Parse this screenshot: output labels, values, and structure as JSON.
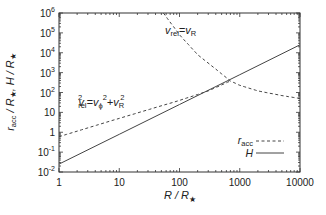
{
  "chart_data": {
    "type": "line",
    "title": "",
    "xlabel": "R / R★",
    "ylabel": "r_acc / R★, H / R★",
    "xscale": "log",
    "yscale": "log",
    "xlim": [
      1,
      10000
    ],
    "ylim": [
      0.01,
      1000000
    ],
    "grid": false,
    "legend_position": "lower right inside",
    "x_ticks": [
      "1",
      "10",
      "100",
      "1000",
      "10000"
    ],
    "y_ticks": [
      "10^-2",
      "10^-1",
      "1",
      "10",
      "10^2",
      "10^3",
      "10^4",
      "10^5",
      "10^6"
    ],
    "series": [
      {
        "name": "r_acc",
        "style": "dashed",
        "segments": [
          {
            "label": "v_rel^2 = v_phi^2 + v_R^2",
            "x": [
              1,
              10,
              100,
              300,
              700
            ],
            "y": [
              0.6,
              5,
              40,
              120,
              380
            ]
          },
          {
            "label": "v_rel = v_R",
            "x": [
              54,
              100,
              200,
              400,
              700,
              1000,
              2000,
              5000,
              10000
            ],
            "y": [
              1000000,
              80000,
              8000,
              1500,
              380,
              230,
              120,
              70,
              50
            ]
          }
        ]
      },
      {
        "name": "H",
        "style": "solid",
        "x": [
          1,
          10,
          100,
          1000,
          10000
        ],
        "y": [
          0.025,
          0.79,
          25,
          790,
          25000
        ]
      }
    ],
    "annotations": [
      {
        "text": "v_rel = v_R",
        "x": 150,
        "y": 200000
      },
      {
        "text": "v_rel^2 = v_phi^2 + v_R^2",
        "x": 3,
        "y": 30
      }
    ]
  },
  "labels": {
    "x_ticks": [
      "1",
      "10",
      "100",
      "1000",
      "10000"
    ],
    "y_ticks": [
      {
        "base": "10",
        "exp": "-2"
      },
      {
        "base": "10",
        "exp": "-1"
      },
      {
        "base": "1",
        "exp": ""
      },
      {
        "base": "10",
        "exp": ""
      },
      {
        "base": "10",
        "exp": "2"
      },
      {
        "base": "10",
        "exp": "3"
      },
      {
        "base": "10",
        "exp": "4"
      },
      {
        "base": "10",
        "exp": "5"
      },
      {
        "base": "10",
        "exp": "6"
      }
    ],
    "xlabel_main": "R / R",
    "xlabel_star": "★",
    "ylabel_part1": "r",
    "ylabel_sub": "acc",
    "ylabel_part2": " / R",
    "ylabel_star1": "★",
    "ylabel_part3": ", H / R",
    "ylabel_star2": "★",
    "annot1_v": "v",
    "annot1_sub": "rel",
    "annot1_eq": "=v",
    "annot1_sub2": "R",
    "annot2_v": "v",
    "annot2_sup": "2",
    "annot2_sub": "rel",
    "annot2_eq": "=v",
    "annot2_sub2": "ϕ",
    "annot2_sup2": "2",
    "annot2_plus": "+v",
    "annot2_sub3": "R",
    "annot2_sup3": "2",
    "legend_racc": "r",
    "legend_racc_sub": "acc",
    "legend_H": "H"
  }
}
